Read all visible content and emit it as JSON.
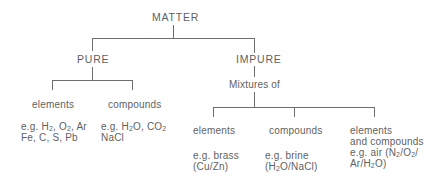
{
  "diagram": {
    "root": {
      "label": "MATTER"
    },
    "pure": {
      "label": "PURE",
      "children": [
        {
          "label": "elements",
          "examples": [
            "e.g. H2, O2, Ar",
            "Fe, C, S, Pb"
          ]
        },
        {
          "label": "compounds",
          "examples": [
            "e.g. H2O, CO2",
            "NaCl"
          ]
        }
      ]
    },
    "impure": {
      "label": "IMPURE",
      "sublabel": "Mixtures of",
      "children": [
        {
          "label": "elements",
          "examples": [
            "e.g. brass",
            "(Cu/Zn)"
          ]
        },
        {
          "label": "compounds",
          "examples": [
            "e.g. brine",
            "(H2O/NaCl)"
          ]
        },
        {
          "label": "elements",
          "label2": "and compounds",
          "examples": [
            "e.g. air (N2/O2/",
            "Ar/H2O)"
          ]
        }
      ]
    }
  },
  "colors": {
    "text": "#5f5f5f",
    "lines": "#6e6e6e",
    "background": "#ffffff"
  }
}
